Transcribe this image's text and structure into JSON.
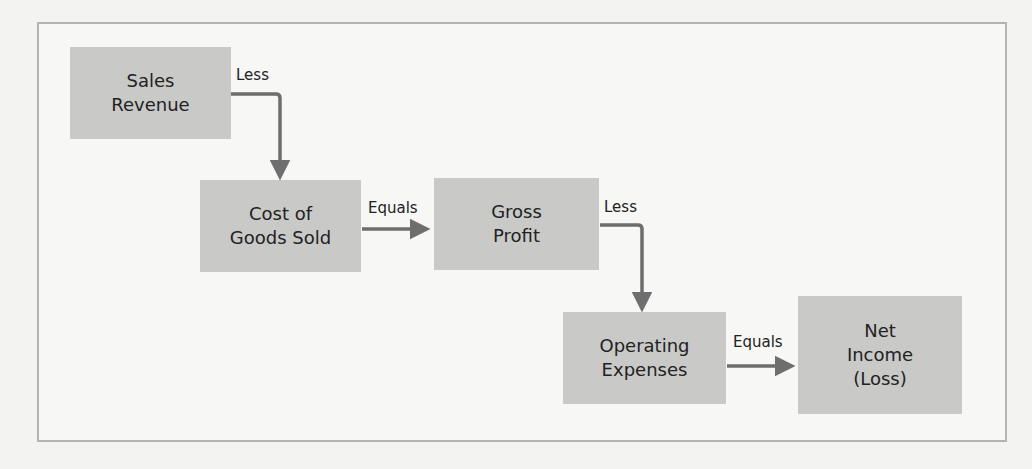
{
  "diagram": {
    "boxes": [
      {
        "id": "sales_revenue",
        "lines": [
          "Sales",
          "Revenue"
        ]
      },
      {
        "id": "cogs",
        "lines": [
          "Cost of",
          "Goods Sold"
        ]
      },
      {
        "id": "gross_profit",
        "lines": [
          "Gross",
          "Profit"
        ]
      },
      {
        "id": "operating_expenses",
        "lines": [
          "Operating",
          "Expenses"
        ]
      },
      {
        "id": "net_income",
        "lines": [
          "Net",
          "Income",
          "(Loss)"
        ]
      }
    ],
    "connectors": [
      {
        "from": "sales_revenue",
        "to": "cogs",
        "label": "Less"
      },
      {
        "from": "cogs",
        "to": "gross_profit",
        "label": "Equals"
      },
      {
        "from": "gross_profit",
        "to": "operating_expenses",
        "label": "Less"
      },
      {
        "from": "operating_expenses",
        "to": "net_income",
        "label": "Equals"
      }
    ],
    "colors": {
      "box_fill": "#c9c9c8",
      "arrow": "#6e6e6e",
      "frame": "#b4b4b2"
    }
  }
}
